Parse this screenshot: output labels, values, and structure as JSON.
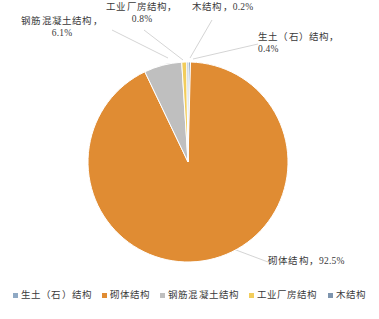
{
  "chart_data": {
    "type": "pie",
    "title": "",
    "subtitle": "",
    "xlabel": "",
    "ylabel": "",
    "grid": false,
    "legend_position": "bottom",
    "categories": [
      "生土（石）结构",
      "砌体结构",
      "钢筋混凝土结构",
      "工业厂房结构",
      "木结构"
    ],
    "values": [
      0.4,
      92.5,
      6.1,
      0.8,
      0.2
    ],
    "unit": "%",
    "colors": [
      "#8FA9C4",
      "#E08C33",
      "#BFBFBF",
      "#F2CD5C",
      "#7E95AE"
    ],
    "slices": [
      {
        "name": "生土（石）结构",
        "value": 0.4,
        "color": "#8FA9C4",
        "label": "生土（石）结构，0.4%"
      },
      {
        "name": "砌体结构",
        "value": 92.5,
        "color": "#E08C33",
        "label": "砌体结构，92.5%"
      },
      {
        "name": "钢筋混凝土结构",
        "value": 6.1,
        "color": "#BFBFBF",
        "label": "钢筋混凝土结构，6.1%"
      },
      {
        "name": "工业厂房结构",
        "value": 0.8,
        "color": "#F2CD5C",
        "label": "工业厂房结构，0.8%"
      },
      {
        "name": "木结构",
        "value": 0.2,
        "color": "#7E95AE",
        "label": "木结构，0.2%"
      }
    ]
  },
  "callouts": {
    "rc": {
      "line1": "钢筋混凝土结构，",
      "line2": "6.1%"
    },
    "industrial": {
      "line1": "工业厂房结构，",
      "line2": "0.8%"
    },
    "wood": {
      "line1": "木结构，0.2%",
      "line2": ""
    },
    "soil": {
      "line1": "生土（石）结构，",
      "line2": "0.4%"
    },
    "masonry": {
      "line1": "砌体结构，92.5%",
      "line2": ""
    }
  },
  "legend": {
    "items": [
      {
        "label": "生土（石）结构",
        "color": "#8FA9C4"
      },
      {
        "label": "砌体结构",
        "color": "#E08C33"
      },
      {
        "label": "钢筋混凝土结构",
        "color": "#BFBFBF"
      },
      {
        "label": "工业厂房结构",
        "color": "#F2CD5C"
      },
      {
        "label": "木结构",
        "color": "#7E95AE"
      }
    ]
  }
}
